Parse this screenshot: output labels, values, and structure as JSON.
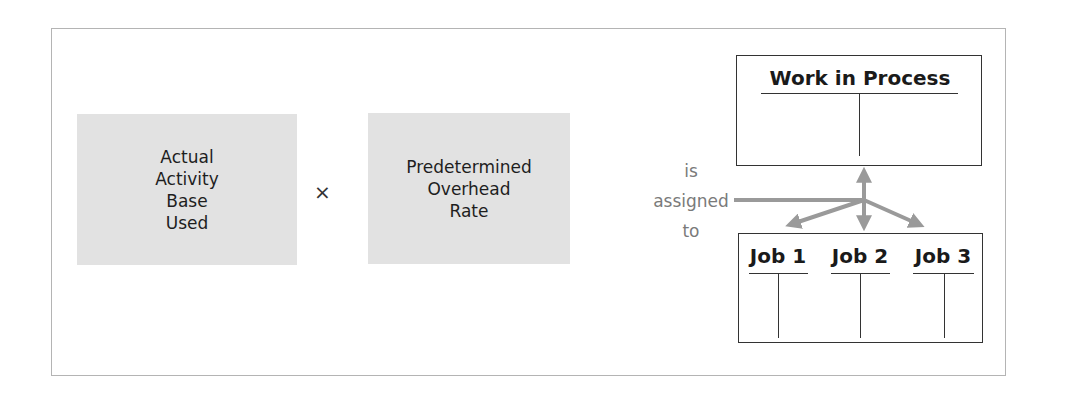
{
  "diagram": {
    "left_box": {
      "lines": [
        "Actual",
        "Activity",
        "Base",
        "Used"
      ]
    },
    "operator": "×",
    "right_box": {
      "lines": [
        "Predetermined",
        "Overhead",
        "Rate"
      ]
    },
    "connector_text": {
      "lines": [
        "is",
        "assigned",
        "to"
      ]
    },
    "wip_account": {
      "title": "Work in Process"
    },
    "job_accounts": [
      {
        "title": "Job 1"
      },
      {
        "title": "Job 2"
      },
      {
        "title": "Job 3"
      }
    ],
    "colors": {
      "box_fill": "#e2e2e2",
      "arrow": "#9a9a9a",
      "frame_border": "#b4b4b4",
      "connector_text": "#7a7a7a"
    }
  }
}
